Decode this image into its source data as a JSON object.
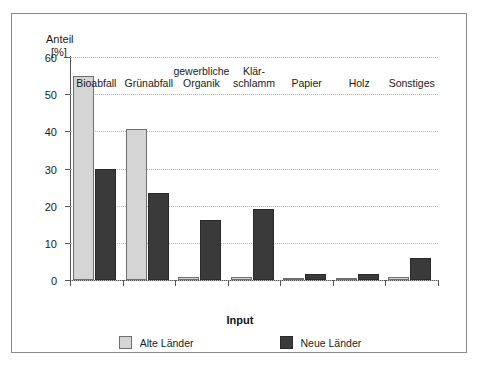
{
  "chart_data": {
    "type": "bar",
    "title": "",
    "xlabel": "Input",
    "ylabel": "Anteil",
    "yunit": "[%]",
    "ylim": [
      0,
      60
    ],
    "yticks": [
      0,
      10,
      20,
      30,
      40,
      50,
      60
    ],
    "ytick_labels": [
      "0",
      "10",
      "20",
      "30",
      "40",
      "50",
      "60"
    ],
    "grid": true,
    "legend_position": "bottom",
    "categories": [
      "Bioabfall",
      "Grünabfall",
      "gewerbliche\nOrganik",
      "Klär-\nschlamm",
      "Papier",
      "Holz",
      "Sonstiges"
    ],
    "category_lines": [
      [
        "Bioabfall"
      ],
      [
        "Grünabfall"
      ],
      [
        "gewerbliche",
        "Organik"
      ],
      [
        "Klär-",
        "schlamm"
      ],
      [
        "Papier"
      ],
      [
        "Holz"
      ],
      [
        "Sonstiges"
      ]
    ],
    "series": [
      {
        "name": "Alte Länder",
        "color": "#d5d5d5",
        "values": [
          55.0,
          40.5,
          0.8,
          0.7,
          0.4,
          0.3,
          0.8
        ]
      },
      {
        "name": "Neue Länder",
        "color": "#3a3a3a",
        "values": [
          29.8,
          23.4,
          16.2,
          19.0,
          1.7,
          1.5,
          6.0
        ]
      }
    ]
  },
  "legend": {
    "entries": [
      {
        "label": "Alte Länder",
        "swatch": "light"
      },
      {
        "label": "Neue Länder",
        "swatch": "dark"
      }
    ]
  }
}
